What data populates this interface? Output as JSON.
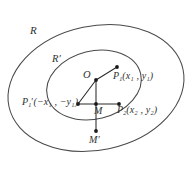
{
  "figure": {
    "type": "geometry-diagram",
    "background_color": "#ffffff",
    "stroke_color": "#4a4a4a",
    "label_color": "#303030",
    "labels": {
      "outer_region": "R",
      "inner_region": "R′",
      "origin": "O",
      "point_M": "M",
      "point_M_prime": "M′",
      "point_P1": "P",
      "point_P1_sub": "1",
      "point_P1_coords": "(x₁ , y₁)",
      "point_P1_prime": "P",
      "point_P1_prime_sub": "1",
      "point_P1_prime_coords": "(−x₁ , −y₁)",
      "point_P2": "P",
      "point_P2_sub": "2",
      "point_P2_coords": "(x₂ , y₂)"
    },
    "label_text_full": {
      "P1": "P₁(x₁ , y₁)",
      "P1_prime": "P₁′(−x₁ , −y₁)",
      "P2": "P₂(x₂ , y₂)"
    },
    "points": [
      {
        "name": "O",
        "x": 96,
        "y": 80,
        "marked": true
      },
      {
        "name": "P1",
        "x": 117,
        "y": 67,
        "marked": true
      },
      {
        "name": "P1prime",
        "x": 78,
        "y": 104,
        "marked": true
      },
      {
        "name": "P2",
        "x": 119,
        "y": 104,
        "marked": true
      },
      {
        "name": "M",
        "x": 96,
        "y": 104,
        "marked": true
      },
      {
        "name": "Mprime",
        "x": 96,
        "y": 131,
        "marked": true
      }
    ],
    "segments": [
      {
        "name": "O-to-P1",
        "from": "O",
        "to": "P1"
      },
      {
        "name": "O-to-P1prime",
        "from": "O",
        "to": "P1prime"
      },
      {
        "name": "O-to-Mprime",
        "from": "O",
        "to": "Mprime"
      },
      {
        "name": "P1prime-to-P2",
        "from": "P1prime",
        "to": "P2"
      }
    ],
    "ellipses": [
      {
        "name": "outer-region-R",
        "cx": 96,
        "cy": 88,
        "rx": 89,
        "ry": 62,
        "rotation": -12
      },
      {
        "name": "inner-region-Rp",
        "cx": 94,
        "cy": 85,
        "rx": 48,
        "ry": 34,
        "rotation": -14
      }
    ]
  }
}
